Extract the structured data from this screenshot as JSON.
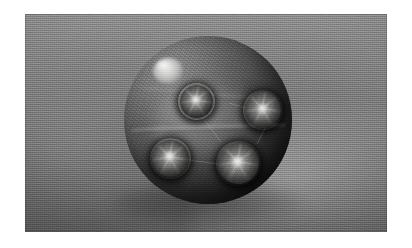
{
  "image": {
    "kind": "photograph",
    "color_mode": "grayscale",
    "caption": "Large rough-textured sphere with four smaller glossy spheres embedded on its surface, photographed against a gray woven cloth backdrop.",
    "frame": {
      "page_background": "#ffffff",
      "photo_left": 25,
      "photo_top": 14,
      "photo_width": 362,
      "photo_height": 218
    },
    "background": {
      "name": "gray-cloth-backdrop",
      "top_color": "#8e8e8e",
      "bottom_color": "#5e5e5e",
      "highlight_region": "lower-right",
      "texture": "fine woven weave"
    },
    "main_sphere": {
      "name": "large-textured-sphere",
      "center_x": 208,
      "center_y": 120,
      "radius": 84,
      "surface": "rough granular stone",
      "base_color": "#4e4e4e",
      "shadow_color": "#161616",
      "specular_highlight": {
        "name": "upper-left-highlight",
        "center_x": 165,
        "center_y": 70,
        "color": "#e8e8e6"
      }
    },
    "small_spheres": [
      {
        "id": "top-center",
        "name": "inset-sphere-top-center",
        "center_x": 196,
        "center_y": 101,
        "diameter": 33,
        "highlight_color": "#fcfcfa"
      },
      {
        "id": "right",
        "name": "inset-sphere-right",
        "center_x": 263,
        "center_y": 110,
        "diameter": 36,
        "highlight_color": "#fcfcfa"
      },
      {
        "id": "bottom-left",
        "name": "inset-sphere-bottom-left",
        "center_x": 170,
        "center_y": 158,
        "diameter": 37,
        "highlight_color": "#fcfcfa"
      },
      {
        "id": "bottom-center",
        "name": "inset-sphere-bottom-center",
        "center_x": 238,
        "center_y": 163,
        "diameter": 41,
        "highlight_color": "#fcfcfa"
      }
    ],
    "filaments": {
      "name": "connecting-filaments",
      "count": 4,
      "color": "#e6e6e4",
      "description": "faint thin threads running between the inset spheres"
    }
  }
}
